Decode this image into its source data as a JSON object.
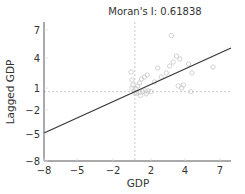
{
  "chart_data": {
    "type": "scatter",
    "title": "Moran's I: 0.61838",
    "xlabel": "GDP",
    "ylabel": "Lagged GDP",
    "xlim": [
      -8,
      7.6
    ],
    "ylim": [
      -8,
      8
    ],
    "x_ticks": [
      -8,
      -5,
      -2,
      2,
      4,
      7
    ],
    "y_ticks": [
      -8,
      -5,
      -2,
      1,
      4,
      7
    ],
    "x_tick_px": [
      44,
      77,
      113,
      151,
      185,
      220
    ],
    "y_tick_px": [
      161,
      134,
      110,
      88,
      58,
      30
    ],
    "reference_lines": {
      "x": 0.3,
      "y": 0.5,
      "style": "dashed",
      "color": "#bbbbbb"
    },
    "regression_line": {
      "slope": 0.618,
      "color": "#333333",
      "from": [
        -8,
        -4.6
      ],
      "to": [
        7.6,
        4.9
      ]
    },
    "point_color": "#c8c8c8",
    "points": [
      [
        -0.1,
        2.6
      ],
      [
        0.0,
        1.8
      ],
      [
        0.1,
        1.3
      ],
      [
        0.0,
        1.0
      ],
      [
        0.2,
        0.6
      ],
      [
        0.3,
        0.3
      ],
      [
        0.4,
        0.9
      ],
      [
        0.6,
        1.2
      ],
      [
        0.8,
        1.5
      ],
      [
        1.0,
        1.9
      ],
      [
        1.3,
        2.1
      ],
      [
        1.6,
        2.3
      ],
      [
        0.5,
        0.3
      ],
      [
        0.8,
        0.4
      ],
      [
        1.1,
        0.5
      ],
      [
        1.4,
        0.6
      ],
      [
        1.7,
        0.6
      ],
      [
        2.0,
        0.5
      ],
      [
        0.9,
        0.0
      ],
      [
        1.5,
        0.2
      ],
      [
        2.2,
        1.6
      ],
      [
        2.6,
        2.1
      ],
      [
        2.9,
        2.5
      ],
      [
        3.1,
        3.2
      ],
      [
        3.3,
        3.6
      ],
      [
        3.5,
        4.2
      ],
      [
        3.7,
        3.9
      ],
      [
        3.2,
        6.4
      ],
      [
        3.6,
        1.2
      ],
      [
        3.8,
        1.0
      ],
      [
        3.9,
        1.3
      ],
      [
        4.3,
        3.4
      ],
      [
        4.6,
        2.5
      ],
      [
        4.5,
        0.5
      ],
      [
        6.4,
        3.1
      ],
      [
        2.4,
        3.0
      ]
    ]
  }
}
